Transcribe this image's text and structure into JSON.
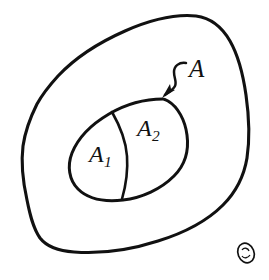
{
  "figure": {
    "kind": "hand-drawn-set-diagram",
    "background_color": "#ffffff",
    "ink_color": "#111111",
    "canvas": {
      "width": 269,
      "height": 280
    },
    "outer_region": {
      "name": "outer-blob",
      "description": "large hand-drawn closed blob enclosing everything"
    },
    "inner_region": {
      "name": "inner-ellipse",
      "description": "tilted oval inside the blob, split into two parts"
    },
    "divider": {
      "name": "partition-curve",
      "description": "curve splitting the oval into a left and a right part"
    },
    "annotation": {
      "arrow_name": "curved-arrow",
      "arrow_points_to": "inner-ellipse",
      "label": "A"
    },
    "labels": {
      "set_a": "A",
      "subset_1_base": "A",
      "subset_1_sub": "1",
      "subset_2_base": "A",
      "subset_2_sub": "2"
    },
    "watermark": {
      "name": "signature-mark",
      "description": "small oval monogram stamp in the bottom-right corner"
    }
  }
}
